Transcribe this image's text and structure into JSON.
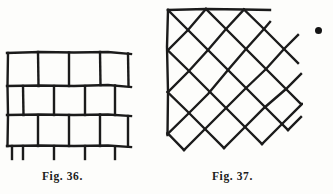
{
  "page": {
    "background_color": "#fdfdfb",
    "ink_color": "#1b1b1b",
    "width": 333,
    "height": 194
  },
  "figures": [
    {
      "id": "fig36",
      "caption": "Fig. 36.",
      "kind": "running-bond-brick-pattern",
      "description": "Hand drawn rectangular brick bond with three courses, alternate courses offset by half a brick",
      "rows": 3,
      "bricks_per_row": 4,
      "offset_rows": [
        2
      ],
      "brick_width": 30,
      "brick_height": 28,
      "line_color": "#1b1b1b",
      "line_width": 2.4
    },
    {
      "id": "fig37",
      "caption": "Fig. 37.",
      "kind": "diagonal-diamond-tile-pattern",
      "description": "Hand drawn diagonal (diamond) bond of squares rotated 45 degrees, bounded at left by a vertical edge and at top by a horizontal edge",
      "diamond_size": 42,
      "columns": 4,
      "rows": 4,
      "line_color": "#1b1b1b",
      "line_width": 2.4,
      "has_left_border": true,
      "has_top_border": true
    }
  ],
  "marks": {
    "ink_dot": {
      "name": "stray-ink-blot",
      "x": 318,
      "y": 30,
      "diameter": 7,
      "color": "#141414"
    }
  }
}
